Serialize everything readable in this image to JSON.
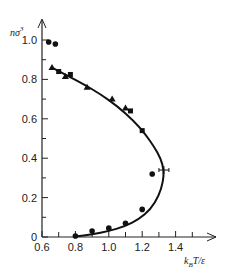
{
  "chart_data": {
    "type": "scatter",
    "title": "",
    "xlabel": "k_B T/ε",
    "ylabel": "nσ³",
    "xlim": [
      0.6,
      1.55
    ],
    "ylim": [
      0,
      1.08
    ],
    "x_ticks": [
      0.6,
      0.8,
      1.0,
      1.2,
      1.4
    ],
    "x_tick_labels": [
      "0.6",
      "0.8",
      "1.0",
      "1.2",
      "1.4"
    ],
    "x_minor_ticks": [
      0.7,
      0.9,
      1.1,
      1.3,
      1.5
    ],
    "y_ticks": [
      0,
      0.2,
      0.4,
      0.6,
      0.8,
      1.0
    ],
    "y_tick_labels": [
      "0",
      "0.2",
      "0.4",
      "0.6",
      "0.8",
      "1.0"
    ],
    "y_minor_ticks": [
      0.1,
      0.3,
      0.5,
      0.7,
      0.9
    ],
    "grid": false,
    "legend": null,
    "series": [
      {
        "name": "coexistence curve (theory)",
        "kind": "line",
        "critical_point": {
          "x": 1.33,
          "y": 0.34
        },
        "points": [
          [
            0.66,
            0.86
          ],
          [
            0.75,
            0.82
          ],
          [
            0.85,
            0.775
          ],
          [
            0.95,
            0.725
          ],
          [
            1.05,
            0.665
          ],
          [
            1.15,
            0.59
          ],
          [
            1.22,
            0.52
          ],
          [
            1.27,
            0.46
          ],
          [
            1.31,
            0.4
          ],
          [
            1.33,
            0.34
          ],
          [
            1.325,
            0.28
          ],
          [
            1.3,
            0.21
          ],
          [
            1.25,
            0.14
          ],
          [
            1.18,
            0.09
          ],
          [
            1.1,
            0.055
          ],
          [
            1.0,
            0.03
          ],
          [
            0.9,
            0.013
          ],
          [
            0.8,
            0.002
          ]
        ]
      },
      {
        "name": "solid-density points",
        "marker": "circle",
        "points": [
          [
            0.64,
            0.99
          ],
          [
            0.68,
            0.98
          ]
        ]
      },
      {
        "name": "liquid branch (triangles)",
        "marker": "triangle",
        "points": [
          [
            0.66,
            0.86
          ],
          [
            0.74,
            0.815
          ],
          [
            0.87,
            0.76
          ],
          [
            1.02,
            0.7
          ],
          [
            1.1,
            0.655
          ]
        ]
      },
      {
        "name": "liquid branch (squares)",
        "marker": "square",
        "points": [
          [
            0.7,
            0.84
          ],
          [
            0.77,
            0.825
          ],
          [
            1.13,
            0.64
          ],
          [
            1.2,
            0.54
          ]
        ]
      },
      {
        "name": "vapor branch (circles)",
        "marker": "circle",
        "points": [
          [
            0.8,
            0.005
          ],
          [
            0.9,
            0.03
          ],
          [
            1.0,
            0.045
          ],
          [
            1.1,
            0.07
          ],
          [
            1.2,
            0.14
          ],
          [
            1.26,
            0.32
          ]
        ]
      }
    ]
  }
}
